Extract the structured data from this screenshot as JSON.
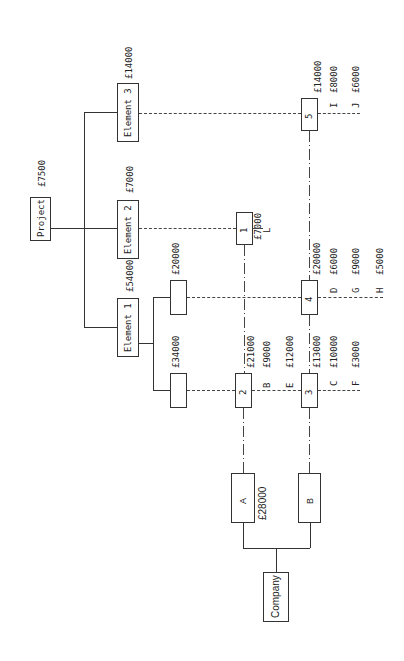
{
  "diagram": {
    "orientation": "rotated-90-ccw",
    "project": {
      "label": "Project",
      "value": "£7500"
    },
    "elements": [
      {
        "label": "Element 1",
        "value": "£54000",
        "sub_items": [
          {
            "value": "£20000"
          },
          {
            "value": "£34000"
          }
        ]
      },
      {
        "label": "Element 2",
        "value": "£7000"
      },
      {
        "label": "Element 3",
        "value": "£14000"
      }
    ],
    "company": {
      "label": "Company",
      "units": [
        {
          "label": "A",
          "value": "£28000"
        },
        {
          "label": "B"
        }
      ]
    },
    "nodes": [
      {
        "id": "1",
        "value": "£7000",
        "items": [
          {
            "code": "L",
            "value": ""
          }
        ]
      },
      {
        "id": "2",
        "value": "£21000",
        "items": [
          {
            "code": "B",
            "value": "£9000"
          },
          {
            "code": "E",
            "value": "£12000"
          }
        ]
      },
      {
        "id": "3",
        "value": "£13000",
        "items": [
          {
            "code": "C",
            "value": "£10000"
          },
          {
            "code": "F",
            "value": "£3000"
          }
        ]
      },
      {
        "id": "4",
        "value": "£20000",
        "items": [
          {
            "code": "D",
            "value": "£6000"
          },
          {
            "code": "G",
            "value": "£9000"
          },
          {
            "code": "H",
            "value": "£5000"
          }
        ]
      },
      {
        "id": "5",
        "value": "£14000",
        "items": [
          {
            "code": "I",
            "value": "£8000"
          },
          {
            "code": "J",
            "value": "£6000"
          }
        ]
      }
    ]
  }
}
